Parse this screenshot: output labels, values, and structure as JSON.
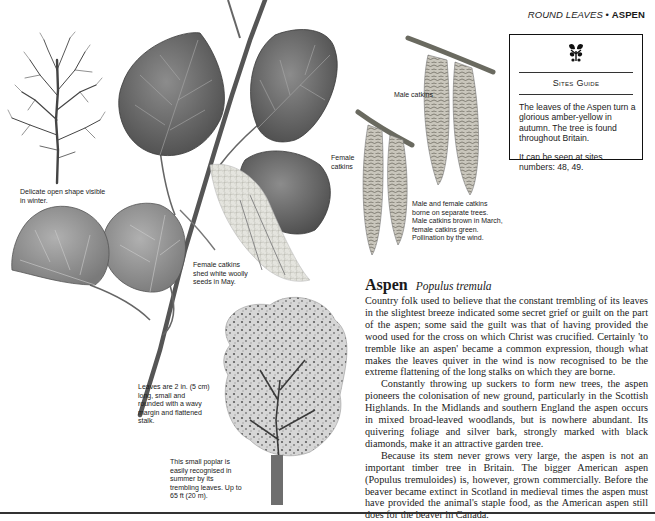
{
  "running_head": {
    "section": "ROUND LEAVES",
    "separator": "•",
    "species": "ASPEN"
  },
  "sites_guide": {
    "logo_icon": "oak-leaf-acorn-emblem",
    "title": "Sites Guide",
    "description": "The leaves of the Aspen turn a glorious amber-yellow in autumn. The tree is found throughout Britain.",
    "seen_at": "It can be seen at sites numbers: 48, 49."
  },
  "captions": {
    "winter_tree": "Delicate open shape visible in winter.",
    "male_catkins": "Male catkins",
    "female_catkins": "Female catkins",
    "catkins_note": "Male and female catkins borne on separate trees. Male catkins brown in March, female catkins green. Pollination by the wind.",
    "female_seeds": "Female catkins shed white woolly seeds in May.",
    "leaves_note": "Leaves are 2 in. (5 cm) long, small and rounded with a wavy margin and flattened stalk.",
    "summer_tree": "This small poplar is easily recognised in summer by its trembling leaves. Up to 65 ft (20 m)."
  },
  "article": {
    "common_name": "Aspen",
    "latin_name": "Populus tremula",
    "paragraphs": [
      "Country folk used to believe that the constant trembling of its leaves in the slightest breeze indicated some secret grief or guilt on the part of the aspen; some said the guilt was that of having provided the wood used for the cross on which Christ was crucified. Certainly 'to tremble like an aspen' became a common expression, though what makes the leaves quiver in the wind is now recognised to be the extreme flattening of the long stalks on which they are borne.",
      "Constantly throwing up suckers to form new trees, the aspen pioneers the colonisation of new ground, particularly in the Scottish Highlands. In the Midlands and southern England the aspen occurs in mixed broad-leaved woodlands, but is nowhere abundant. Its quivering foliage and silver bark, strongly marked with black diamonds, make it an attractive garden tree.",
      "Because its stem never grows very large, the aspen is not an important timber tree in Britain. The bigger American aspen (Populus tremuloides) is, however, grown commercially. Before the beaver became extinct in Scotland in medieval times the aspen must have provided the animal's staple food, as the American aspen still does for the beaver in Canada."
    ]
  },
  "illustrations": [
    "winter-tree-illustration",
    "leafy-twig-illustration",
    "male-catkins-illustration",
    "female-catkins-illustration",
    "summer-tree-illustration"
  ],
  "colors": {
    "ink": "#1a1a1a",
    "leaf_dark": "#5e5e5e",
    "leaf_mid": "#7a7a7a",
    "leaf_light": "#9a9a9a",
    "catkin": "#8a8a80",
    "rule": "#333333"
  }
}
